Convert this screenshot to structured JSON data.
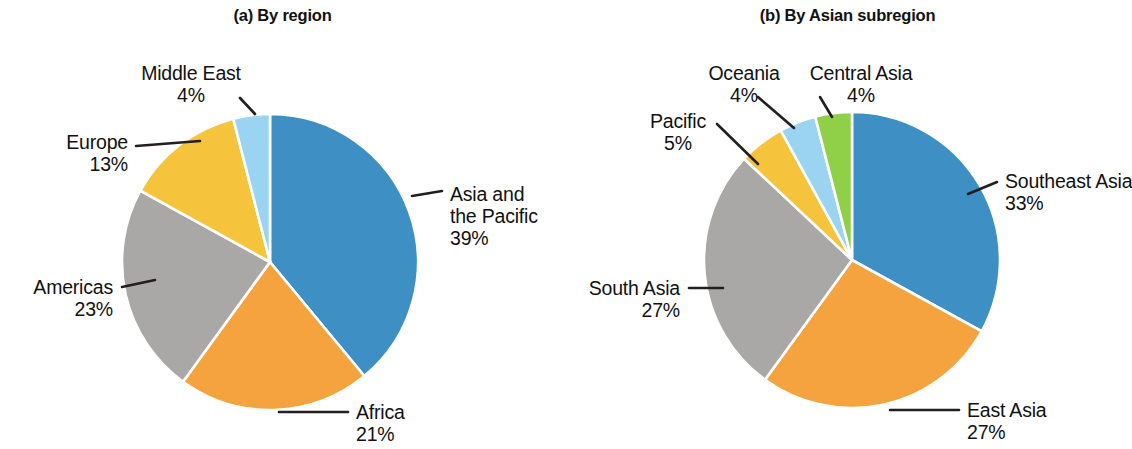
{
  "figure": {
    "background": "#ffffff",
    "text_color": "#111111"
  },
  "panels": [
    {
      "title": "(a) By region",
      "center": {
        "x": 270,
        "y": 262
      },
      "radius": 148
    },
    {
      "title": "(b) By Asian subregion",
      "center": {
        "x": 287,
        "y": 260
      },
      "radius": 148
    }
  ],
  "palette": {
    "blue": "#3d8fc4",
    "orange": "#f5a33f",
    "gray": "#a9a8a6",
    "yellow": "#f5c43c",
    "light_blue": "#9ad4f0",
    "green": "#8fd048",
    "leader_line": "#231f20"
  },
  "labels": {
    "a": {
      "asia_pacific_name": "Asia and",
      "asia_pacific_name2": "the Pacific",
      "asia_pacific_pct": "39%",
      "africa_name": "Africa",
      "africa_pct": "21%",
      "americas_name": "Americas",
      "americas_pct": "23%",
      "europe_name": "Europe",
      "europe_pct": "13%",
      "middle_east_name": "Middle East",
      "middle_east_pct": "4%"
    },
    "b": {
      "southeast_asia_name": "Southeast Asia",
      "southeast_asia_pct": "33%",
      "east_asia_name": "East Asia",
      "east_asia_pct": "27%",
      "south_asia_name": "South Asia",
      "south_asia_pct": "27%",
      "pacific_name": "Pacific",
      "pacific_pct": "5%",
      "oceania_name": "Oceania",
      "oceania_pct": "4%",
      "central_asia_name": "Central Asia",
      "central_asia_pct": "4%"
    }
  },
  "chart_data": [
    {
      "type": "pie",
      "title": "(a) By region",
      "labels": [
        "Asia and the Pacific",
        "Africa",
        "Americas",
        "Europe",
        "Middle East"
      ],
      "values": [
        39,
        21,
        23,
        13,
        4
      ],
      "unit": "%",
      "colors": [
        "#3d8fc4",
        "#f5a33f",
        "#a9a8a6",
        "#f5c43c",
        "#9ad4f0"
      ],
      "start_angle_deg": 0,
      "direction": "clockwise",
      "legend": "none",
      "labels_position": "outside-with-leader-lines",
      "grid": false
    },
    {
      "type": "pie",
      "title": "(b) By Asian subregion",
      "labels": [
        "Southeast Asia",
        "East Asia",
        "South Asia",
        "Pacific",
        "Oceania",
        "Central Asia"
      ],
      "values": [
        33,
        27,
        27,
        5,
        4,
        4
      ],
      "unit": "%",
      "colors": [
        "#3d8fc4",
        "#f5a33f",
        "#a9a8a6",
        "#f5c43c",
        "#9ad4f0",
        "#8fd048"
      ],
      "start_angle_deg": 0,
      "direction": "clockwise",
      "legend": "none",
      "labels_position": "outside-with-leader-lines",
      "grid": false
    }
  ]
}
